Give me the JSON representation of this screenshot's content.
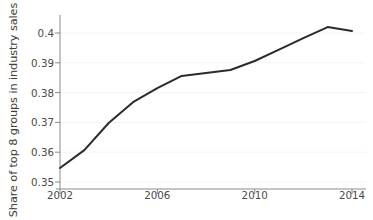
{
  "chart_data": {
    "type": "line",
    "title": "",
    "xlabel": "",
    "ylabel": "Share of top 8 groups in industry sales",
    "x": [
      2002,
      2003,
      2004,
      2005,
      2006,
      2007,
      2008,
      2009,
      2010,
      2011,
      2012,
      2013,
      2014
    ],
    "values": [
      0.3547,
      0.3607,
      0.3698,
      0.3768,
      0.3815,
      0.3856,
      0.3866,
      0.3876,
      0.3906,
      0.3944,
      0.3983,
      0.402,
      0.4007
    ],
    "series": [
      {
        "name": "Share of top 8 groups in industry sales",
        "values": [
          0.3547,
          0.3607,
          0.3698,
          0.3768,
          0.3815,
          0.3856,
          0.3866,
          0.3876,
          0.3906,
          0.3944,
          0.3983,
          0.402,
          0.4007
        ]
      }
    ],
    "xlim": [
      2002,
      2014
    ],
    "ylim": [
      0.35,
      0.4045
    ],
    "xticks": [
      2002,
      2006,
      2010,
      2014
    ],
    "xtick_labels": [
      "2002",
      "2006",
      "2010",
      "2014"
    ],
    "yticks": [
      0.35,
      0.36,
      0.37,
      0.38,
      0.39,
      0.4
    ],
    "ytick_labels": [
      "0.35",
      "0.36",
      "0.37",
      "0.38",
      "0.39",
      "0.4"
    ],
    "grid": true,
    "grid_axis": "y",
    "legend": false,
    "legend_position": "none",
    "line_color": "#2b2b2b",
    "grid_color": "#f2f2f2",
    "axis_color": "#808080",
    "background_color": "#ffffff",
    "annotations": []
  },
  "axis": {
    "y_title": "Share of top 8 groups in industry sales",
    "y_tick_0": "0.35",
    "y_tick_1": "0.36",
    "y_tick_2": "0.37",
    "y_tick_3": "0.38",
    "y_tick_4": "0.39",
    "y_tick_5": "0.4",
    "x_tick_0": "2002",
    "x_tick_1": "2006",
    "x_tick_2": "2010",
    "x_tick_3": "2014"
  }
}
